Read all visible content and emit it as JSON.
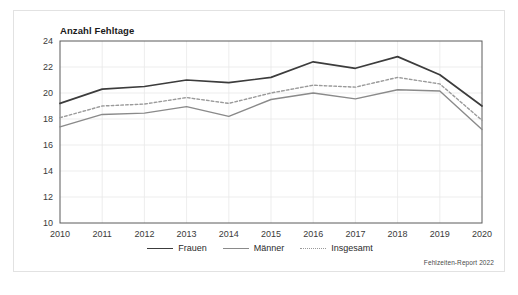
{
  "figure": {
    "title": "Anzahl Fehltage",
    "source_note": "Fehlzeiten-Report 2022"
  },
  "legend": {
    "position": "bottom-center",
    "entries": [
      {
        "label": "Frauen",
        "style": "solid",
        "color": "#3c3c3c"
      },
      {
        "label": "Männer",
        "style": "solid",
        "color": "#8a8a8a"
      },
      {
        "label": "Insgesamt",
        "style": "dotted",
        "color": "#9a9a9a"
      }
    ]
  },
  "chart_data": {
    "type": "line",
    "title": "Anzahl Fehltage",
    "xlabel": "",
    "ylabel": "Anzahl Fehltage",
    "x": [
      "2010",
      "2011",
      "2012",
      "2013",
      "2014",
      "2015",
      "2016",
      "2017",
      "2018",
      "2019",
      "2020"
    ],
    "categories": [
      "2010",
      "2011",
      "2012",
      "2013",
      "2014",
      "2015",
      "2016",
      "2017",
      "2018",
      "2019",
      "2020"
    ],
    "xtick_labels": [
      "2010",
      "2011",
      "2012",
      "2013",
      "2014",
      "2015",
      "2016",
      "2017",
      "2018",
      "2019",
      "2020"
    ],
    "ytick_labels": [
      "10",
      "12",
      "14",
      "16",
      "18",
      "20",
      "22",
      "24"
    ],
    "yticks": [
      10,
      12,
      14,
      16,
      18,
      20,
      22,
      24
    ],
    "ylim": [
      10,
      24
    ],
    "grid": true,
    "series": [
      {
        "name": "Frauen",
        "color": "#3c3c3c",
        "style": "solid",
        "values": [
          19.2,
          20.3,
          20.5,
          21.0,
          20.8,
          21.2,
          22.4,
          21.9,
          22.8,
          21.4,
          19.0
        ]
      },
      {
        "name": "Männer",
        "color": "#8a8a8a",
        "style": "solid",
        "values": [
          17.4,
          18.35,
          18.45,
          18.95,
          18.2,
          19.5,
          20.0,
          19.55,
          20.25,
          20.15,
          17.2
        ]
      },
      {
        "name": "Insgesamt",
        "color": "#9a9a9a",
        "style": "dotted",
        "values": [
          18.1,
          19.0,
          19.15,
          19.65,
          19.2,
          20.0,
          20.6,
          20.45,
          21.2,
          20.7,
          17.9
        ]
      }
    ]
  }
}
